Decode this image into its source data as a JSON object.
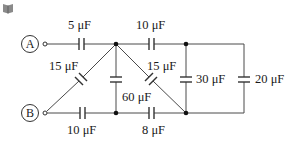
{
  "diagram": {
    "type": "capacitor-circuit",
    "icon": "book-icon",
    "colors": {
      "wire": "#4a4a4a",
      "text": "#1a1a1a",
      "dot": "#111111"
    },
    "terminals": [
      {
        "id": "A",
        "label": "A"
      },
      {
        "id": "B",
        "label": "B"
      }
    ],
    "capacitors": [
      {
        "id": "c_top_left",
        "label": "5 μF"
      },
      {
        "id": "c_top_mid",
        "label": "10 μF"
      },
      {
        "id": "c_diag_left",
        "label": "15 μF"
      },
      {
        "id": "c_diag_right",
        "label": "15 μF"
      },
      {
        "id": "c_vertical_mid",
        "label": "60 μF"
      },
      {
        "id": "c_vertical_right",
        "label": "30 μF"
      },
      {
        "id": "c_far_right",
        "label": "20 μF"
      },
      {
        "id": "c_bottom_left",
        "label": "10 μF"
      },
      {
        "id": "c_bottom_mid",
        "label": "8 μF"
      }
    ]
  }
}
